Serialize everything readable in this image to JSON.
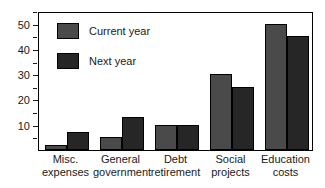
{
  "chart_data": {
    "type": "bar",
    "title": "",
    "xlabel": "",
    "ylabel": "",
    "categories": [
      "Misc. expenses",
      "General government",
      "Debt retirement",
      "Social projects",
      "Education costs"
    ],
    "category_lines": [
      [
        "Misc.",
        "expenses"
      ],
      [
        "General",
        "government"
      ],
      [
        "Debt",
        "retirement"
      ],
      [
        "Social",
        "projects"
      ],
      [
        "Education",
        "costs"
      ]
    ],
    "series": [
      {
        "name": "Current year",
        "color": "#4a4a4a",
        "values": [
          2,
          5,
          10,
          30,
          50
        ]
      },
      {
        "name": "Next year",
        "color": "#262626",
        "values": [
          7,
          13,
          10,
          25,
          45
        ]
      }
    ],
    "ylim": [
      0,
      55
    ],
    "yticks": [
      10,
      20,
      30,
      40,
      50
    ],
    "ytick_labels": [
      "10",
      "20",
      "30",
      "40",
      "50"
    ],
    "yminor_ticks": [
      5,
      15,
      25,
      35,
      45,
      55
    ],
    "grid": false,
    "legend_position": "upper left",
    "frame": true
  }
}
